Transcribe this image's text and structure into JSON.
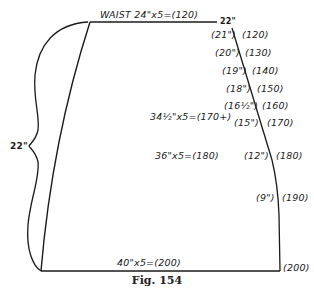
{
  "figure": {
    "caption": "Fig. 154",
    "waist_label": "WAIST 24\"x5=(120)",
    "waist_corner_label": "22\"",
    "hip_label": "34½\"x5=(170+)",
    "mid_label": "36\"x5=(180)",
    "hem_label": "40\"x5=(200)",
    "hem_corner_label": "(200)",
    "height_label": "22\""
  },
  "side_marks": [
    {
      "inches": "(21\")",
      "value": "(120)"
    },
    {
      "inches": "(20\")",
      "value": "(130)"
    },
    {
      "inches": "(19\")",
      "value": "(140)"
    },
    {
      "inches": "(18\")",
      "value": "(150)"
    },
    {
      "inches": "(16½\")",
      "value": "(160)"
    },
    {
      "inches": "(15\")",
      "value": "(170)"
    },
    {
      "inches": "(12\")",
      "value": "(180)"
    },
    {
      "inches": "(9\")",
      "value": "(190)"
    }
  ],
  "colors": {
    "line": "#1a1a1a",
    "background": "#ffffff"
  }
}
